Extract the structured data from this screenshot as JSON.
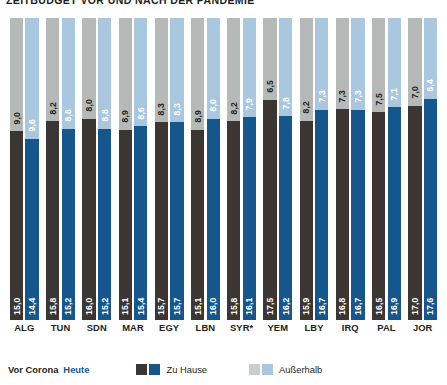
{
  "title": "ZEITBUDGET VOR UND NACH DER PANDEMIE",
  "legend": {
    "pre_label": "Vor Corona",
    "now_label": "Heute",
    "home_label": "Zu Hause",
    "outside_label": "Außerhalb",
    "colors": {
      "home_pre": "#3b3632",
      "home_now": "#15578c",
      "out_pre": "#b5b9b8",
      "out_now": "#a9c8e0"
    }
  },
  "chart_data": {
    "type": "bar",
    "subtype": "stacked-100-percent-grouped",
    "title": "ZEITBUDGET VOR UND NACH DER PANDEMIE",
    "xlabel": "",
    "ylabel": "",
    "ylim": [
      0,
      24
    ],
    "grid": false,
    "legend_position": "bottom",
    "unit": "Stunden",
    "decimal_separator": ",",
    "categories": [
      "ALG",
      "TUN",
      "SDN",
      "MAR",
      "EGY",
      "LBN",
      "SYR*",
      "YEM",
      "LBY",
      "IRQ",
      "PAL",
      "JOR"
    ],
    "series": [
      {
        "name": "Zu Hause — Vor Corona",
        "key": "home_pre",
        "color": "#3b3632",
        "values": [
          15.0,
          15.8,
          16.0,
          15.1,
          15.7,
          15.1,
          15.8,
          17.5,
          15.9,
          16.8,
          16.5,
          17.0
        ],
        "labels": [
          "15,0",
          "15,8",
          "16,0",
          "15,1",
          "15,7",
          "15,1",
          "15,8",
          "17,5",
          "15,9",
          "16,8",
          "16,5",
          "17,0"
        ]
      },
      {
        "name": "Zu Hause — Heute",
        "key": "home_now",
        "color": "#15578c",
        "values": [
          14.4,
          15.2,
          15.2,
          15.4,
          15.7,
          16.0,
          16.1,
          16.2,
          16.7,
          16.7,
          16.9,
          17.6
        ],
        "labels": [
          "14,4",
          "15,2",
          "15,2",
          "15,4",
          "15,7",
          "16,0",
          "16,1",
          "16,2",
          "16,7",
          "16,7",
          "16,9",
          "17,6"
        ]
      },
      {
        "name": "Außerhalb — Vor Corona",
        "key": "out_pre",
        "color": "#b5b9b8",
        "values": [
          9.0,
          8.2,
          8.0,
          8.9,
          8.3,
          8.9,
          8.2,
          6.5,
          8.2,
          7.3,
          7.5,
          7.0
        ],
        "labels": [
          "9,0",
          "8,2",
          "8,0",
          "8,9",
          "8,3",
          "8,9",
          "8,2",
          "6,5",
          "8,2",
          "7,3",
          "7,5",
          "7,0"
        ]
      },
      {
        "name": "Außerhalb — Heute",
        "key": "out_now",
        "color": "#a9c8e0",
        "values": [
          9.6,
          8.8,
          8.8,
          8.6,
          8.3,
          8.0,
          7.9,
          7.8,
          7.3,
          7.3,
          7.1,
          6.4
        ],
        "labels": [
          "9,6",
          "8,8",
          "8,8",
          "8,6",
          "8,3",
          "8,0",
          "7,9",
          "7,8",
          "7,3",
          "7,3",
          "7,1",
          "6,4"
        ]
      }
    ]
  }
}
